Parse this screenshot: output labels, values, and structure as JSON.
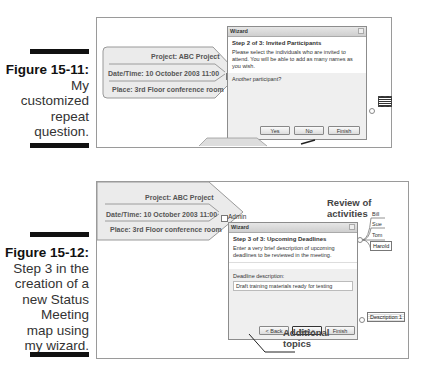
{
  "figures": [
    {
      "id": "fig-15-11",
      "caption": {
        "label": "Figure 15-11:",
        "lines": [
          "My",
          "customized",
          "repeat",
          "question."
        ]
      },
      "topic": {
        "project": "Project: ABC Project",
        "datetime": "Date/Time: 10 October 2003 11:00",
        "place": "Place: 3rd Floor conference room"
      },
      "wizard": {
        "title": "Wizard",
        "step": "Step 2 of 3: Invited Participants",
        "description": "Please select the individuals who are invited to attend. You will be able to add as many names as you wish.",
        "prompt": "Another participant?",
        "buttons": {
          "yes": "Yes",
          "no": "No",
          "finish": "Finish"
        }
      },
      "side_node": "Sub-topic"
    },
    {
      "id": "fig-15-12",
      "caption": {
        "label": "Figure 15-12:",
        "lines": [
          "Step 3 in the",
          "creation of a",
          "new Status",
          "Meeting",
          "map using",
          "my wizard."
        ]
      },
      "topic": {
        "project": "Project: ABC Project",
        "datetime": "Date/Time: 10 October 2003 11:00",
        "place": "Place: 3rd Floor conference room"
      },
      "admin_label": "Admin",
      "review_label": "Review of activities",
      "people": [
        "Bill",
        "Sue",
        "Tom",
        "Harold"
      ],
      "wizard": {
        "title": "Wizard",
        "step": "Step 3 of 3: Upcoming Deadlines",
        "description": "Enter a very brief description of upcoming deadlines to be reviewed in the meeting.",
        "field_label": "Deadline description:",
        "field_value": "Draft training materials ready for testing",
        "buttons": {
          "back": "< Back",
          "next": "Next >",
          "finish": "Finish"
        }
      },
      "description_node": "Description 1",
      "additional_topics": "Additional topics"
    }
  ]
}
